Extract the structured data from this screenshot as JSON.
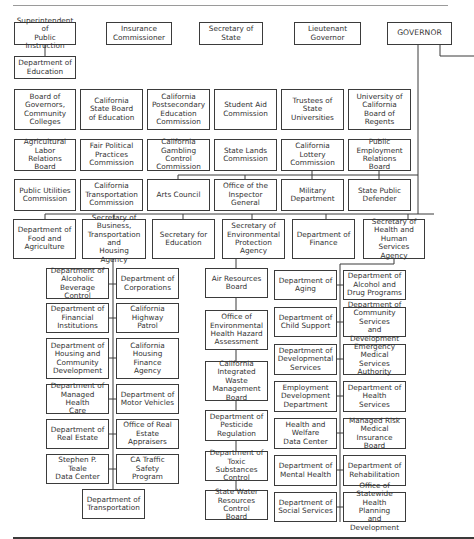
{
  "elected_officials": [
    {
      "id": "superintendent",
      "label": "Superintendent of\nPublic Instruction",
      "x": 14,
      "y": 22,
      "w": 62,
      "h": 23
    },
    {
      "id": "insurance",
      "label": "Insurance\nCommissioner",
      "x": 106,
      "y": 22,
      "w": 66,
      "h": 23
    },
    {
      "id": "secretary-of-state",
      "label": "Secretary of\nState",
      "x": 199,
      "y": 22,
      "w": 64,
      "h": 23
    },
    {
      "id": "lt-governor",
      "label": "Lieutenant\nGovernor",
      "x": 294,
      "y": 22,
      "w": 67,
      "h": 23
    },
    {
      "id": "governor",
      "label": "GOVERNOR",
      "x": 387,
      "y": 22,
      "w": 65,
      "h": 23
    }
  ],
  "education": {
    "id": "dept-education",
    "label": "Department of\nEducation",
    "x": 14,
    "y": 56,
    "w": 62,
    "h": 23
  },
  "boards_row_1": [
    {
      "id": "board-of-governors",
      "label": "Board of\nGovernors,\nCommunity\nColleges",
      "x": 14,
      "y": 89,
      "w": 62,
      "h": 41
    },
    {
      "id": "state-board-education",
      "label": "California\nState Board\nof Education",
      "x": 80,
      "y": 89,
      "w": 63,
      "h": 41
    },
    {
      "id": "postsecondary-commission",
      "label": "California\nPostsecondary\nEducation\nCommission",
      "x": 147,
      "y": 89,
      "w": 63,
      "h": 41
    },
    {
      "id": "student-aid",
      "label": "Student Aid\nCommission",
      "x": 214,
      "y": 89,
      "w": 63,
      "h": 41
    },
    {
      "id": "trustees-state-universities",
      "label": "Trustees of\nState\nUniversities",
      "x": 281,
      "y": 89,
      "w": 63,
      "h": 41
    },
    {
      "id": "uc-regents",
      "label": "University of\nCalifornia\nBoard of Regents",
      "x": 348,
      "y": 89,
      "w": 63,
      "h": 41
    }
  ],
  "boards_row_2": [
    {
      "id": "ag-labor-relations",
      "label": "Agricultural\nLabor\nRelations Board",
      "x": 14,
      "y": 139,
      "w": 62,
      "h": 32
    },
    {
      "id": "fair-political-practices",
      "label": "Fair Political\nPractices\nCommission",
      "x": 80,
      "y": 139,
      "w": 63,
      "h": 32
    },
    {
      "id": "gambling-control",
      "label": "California\nGambling Control\nCommission",
      "x": 147,
      "y": 139,
      "w": 63,
      "h": 32
    },
    {
      "id": "state-lands",
      "label": "State Lands\nCommission",
      "x": 214,
      "y": 139,
      "w": 63,
      "h": 32
    },
    {
      "id": "lottery-commission",
      "label": "California\nLottery\nCommission",
      "x": 281,
      "y": 139,
      "w": 63,
      "h": 32
    },
    {
      "id": "perb",
      "label": "Public\nEmployment\nRelations Board",
      "x": 348,
      "y": 139,
      "w": 63,
      "h": 32
    }
  ],
  "boards_row_3": [
    {
      "id": "puc",
      "label": "Public Utilities\nCommission",
      "x": 14,
      "y": 179,
      "w": 62,
      "h": 32
    },
    {
      "id": "transportation-commission",
      "label": "California\nTransportation\nCommission",
      "x": 80,
      "y": 179,
      "w": 63,
      "h": 32
    },
    {
      "id": "arts-council",
      "label": "Arts Council",
      "x": 147,
      "y": 179,
      "w": 63,
      "h": 32
    },
    {
      "id": "inspector-general",
      "label": "Office of the\nInspector General",
      "x": 214,
      "y": 179,
      "w": 63,
      "h": 32
    },
    {
      "id": "military-dept",
      "label": "Military\nDepartment",
      "x": 281,
      "y": 179,
      "w": 63,
      "h": 32
    },
    {
      "id": "state-public-defender",
      "label": "State Public\nDefender",
      "x": 348,
      "y": 179,
      "w": 63,
      "h": 32
    }
  ],
  "cabinet": [
    {
      "id": "food-agriculture",
      "label": "Department of\nFood and\nAgriculture",
      "x": 13,
      "y": 219,
      "w": 63,
      "h": 40
    },
    {
      "id": "bth-agency",
      "label": "Secretary of\nBusiness,\nTransportation and\nHousing Agency",
      "x": 82,
      "y": 219,
      "w": 64,
      "h": 40
    },
    {
      "id": "secretary-education",
      "label": "Secretary for\nEducation",
      "x": 152,
      "y": 219,
      "w": 63,
      "h": 40
    },
    {
      "id": "epa",
      "label": "Secretary of\nEnvironmental\nProtection Agency",
      "x": 222,
      "y": 219,
      "w": 63,
      "h": 40
    },
    {
      "id": "finance",
      "label": "Department of\nFinance",
      "x": 292,
      "y": 219,
      "w": 63,
      "h": 40
    },
    {
      "id": "hhs-agency",
      "label": "Secretary of\nHealth and Human\nServices\nAgency",
      "x": 363,
      "y": 219,
      "w": 62,
      "h": 40
    }
  ],
  "bth_departments": [
    {
      "id": "abc",
      "label": "Department of\nAlcoholic Beverage\nControl",
      "x": 46,
      "y": 268,
      "w": 63,
      "h": 31
    },
    {
      "id": "corporations",
      "label": "Department of\nCorporations",
      "x": 116,
      "y": 268,
      "w": 63,
      "h": 31
    },
    {
      "id": "financial-institutions",
      "label": "Department of\nFinancial\nInstitutions",
      "x": 46,
      "y": 303,
      "w": 63,
      "h": 30
    },
    {
      "id": "chp",
      "label": "California Highway\nPatrol",
      "x": 116,
      "y": 303,
      "w": 63,
      "h": 30
    },
    {
      "id": "hcd",
      "label": "Department of\nHousing and\nCommunity\nDevelopment",
      "x": 46,
      "y": 338,
      "w": 63,
      "h": 41
    },
    {
      "id": "housing-finance",
      "label": "California Housing\nFinance Agency",
      "x": 116,
      "y": 338,
      "w": 63,
      "h": 41
    },
    {
      "id": "managed-health-care",
      "label": "Department of\nManaged Health\nCare",
      "x": 46,
      "y": 384,
      "w": 63,
      "h": 30
    },
    {
      "id": "dmv",
      "label": "Department of\nMotor Vehicles",
      "x": 116,
      "y": 384,
      "w": 63,
      "h": 30
    },
    {
      "id": "real-estate",
      "label": "Department of\nReal Estate",
      "x": 46,
      "y": 419,
      "w": 63,
      "h": 30
    },
    {
      "id": "real-estate-appraisers",
      "label": "Office of Real\nEstate Appraisers",
      "x": 116,
      "y": 419,
      "w": 63,
      "h": 30
    },
    {
      "id": "teale-data-center",
      "label": "Stephen P. Teale\nData Center",
      "x": 46,
      "y": 454,
      "w": 63,
      "h": 30
    },
    {
      "id": "traffic-safety",
      "label": "CA Traffic Safety\nProgram",
      "x": 116,
      "y": 454,
      "w": 63,
      "h": 30
    },
    {
      "id": "caltrans",
      "label": "Department of\nTransportation",
      "x": 82,
      "y": 489,
      "w": 63,
      "h": 30
    }
  ],
  "epa_departments": [
    {
      "id": "air-resources",
      "label": "Air Resources\nBoard",
      "x": 205,
      "y": 268,
      "w": 63,
      "h": 30
    },
    {
      "id": "oehha",
      "label": "Office of\nEnvironmental\nHealth Hazard\nAssessment",
      "x": 205,
      "y": 310,
      "w": 63,
      "h": 40
    },
    {
      "id": "ciwmb",
      "label": "California\nIntegrated Waste\nManagement\nBoard",
      "x": 205,
      "y": 361,
      "w": 63,
      "h": 40
    },
    {
      "id": "pesticide-regulation",
      "label": "Department of\nPesticide\nRegulation",
      "x": 205,
      "y": 410,
      "w": 63,
      "h": 31
    },
    {
      "id": "toxic-substances",
      "label": "Department of\nToxic Substances\nControl",
      "x": 205,
      "y": 451,
      "w": 63,
      "h": 30
    },
    {
      "id": "water-resources",
      "label": "State Water\nResources Control\nBoard",
      "x": 205,
      "y": 490,
      "w": 63,
      "h": 30
    }
  ],
  "hhs_departments": [
    {
      "id": "aging",
      "label": "Department of\nAging",
      "x": 274,
      "y": 270,
      "w": 63,
      "h": 30
    },
    {
      "id": "alcohol-drug",
      "label": "Department of\nAlcohol and\nDrug Programs",
      "x": 343,
      "y": 270,
      "w": 63,
      "h": 30
    },
    {
      "id": "child-support",
      "label": "Department of\nChild Support",
      "x": 274,
      "y": 307,
      "w": 63,
      "h": 30
    },
    {
      "id": "community-services",
      "label": "Department of\nCommunity Services\nand Development",
      "x": 343,
      "y": 307,
      "w": 63,
      "h": 30
    },
    {
      "id": "developmental-services",
      "label": "Department of\nDevelopmental\nServices",
      "x": 274,
      "y": 344,
      "w": 63,
      "h": 31
    },
    {
      "id": "emsa",
      "label": "Emergency\nMedical Services\nAuthority",
      "x": 343,
      "y": 344,
      "w": 63,
      "h": 31
    },
    {
      "id": "edd",
      "label": "Employment\nDevelopment\nDepartment",
      "x": 274,
      "y": 381,
      "w": 63,
      "h": 31
    },
    {
      "id": "health-services",
      "label": "Department of\nHealth Services",
      "x": 343,
      "y": 381,
      "w": 63,
      "h": 31
    },
    {
      "id": "health-welfare-data",
      "label": "Health and\nWelfare\nData Center",
      "x": 274,
      "y": 418,
      "w": 63,
      "h": 31
    },
    {
      "id": "mrmib",
      "label": "Managed Risk\nMedical Insurance\nBoard",
      "x": 343,
      "y": 418,
      "w": 63,
      "h": 31
    },
    {
      "id": "mental-health",
      "label": "Department of\nMental Health",
      "x": 274,
      "y": 455,
      "w": 63,
      "h": 31
    },
    {
      "id": "rehabilitation",
      "label": "Department of\nRehabilitation",
      "x": 343,
      "y": 455,
      "w": 63,
      "h": 31
    },
    {
      "id": "social-services",
      "label": "Department of\nSocial Services",
      "x": 274,
      "y": 492,
      "w": 63,
      "h": 30
    },
    {
      "id": "oshpd",
      "label": "Office of Statewide\nHealth Planning\nand Development",
      "x": 343,
      "y": 492,
      "w": 63,
      "h": 30
    }
  ],
  "colors": {
    "line": "#3b3b3b",
    "border": "#3b3b3b",
    "text": "#333333",
    "background": "#ffffff"
  }
}
